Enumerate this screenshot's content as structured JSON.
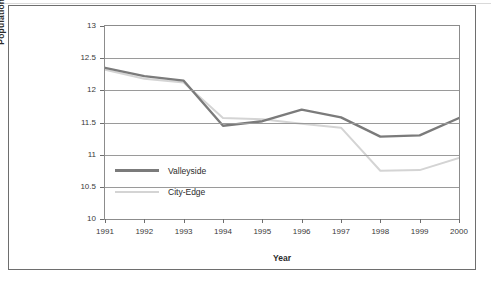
{
  "chart_data": {
    "type": "line",
    "title": "",
    "xlabel": "Year",
    "ylabel": "Population (thousands)",
    "categories": [
      "1991",
      "1992",
      "1993",
      "1994",
      "1995",
      "1996",
      "1997",
      "1998",
      "1999",
      "2000"
    ],
    "x": [
      1991,
      1992,
      1993,
      1994,
      1995,
      1996,
      1997,
      1998,
      1999,
      2000
    ],
    "xlim": [
      1991,
      2000
    ],
    "ylim": [
      10,
      13
    ],
    "yticks": [
      "10",
      "10.5",
      "11",
      "11.5",
      "12",
      "12.5",
      "13"
    ],
    "ytick_values": [
      10,
      10.5,
      11,
      11.5,
      12,
      12.5,
      13
    ],
    "grid": true,
    "legend_position": "inside-lower-left",
    "series": [
      {
        "name": "Valleyside",
        "color": "#7b7b7b",
        "line_width": 2.4,
        "values": [
          12.35,
          12.22,
          12.15,
          11.45,
          11.52,
          11.7,
          11.58,
          11.28,
          11.3,
          11.57
        ]
      },
      {
        "name": "City-Edge",
        "color": "#d4d4d4",
        "line_width": 2.0,
        "values": [
          12.32,
          12.18,
          12.12,
          11.57,
          11.55,
          11.48,
          11.42,
          10.75,
          10.76,
          10.95
        ]
      }
    ]
  },
  "axis": {
    "y_title": "Population (thousands)",
    "x_title": "Year"
  },
  "legend": {
    "items": [
      {
        "label": "Valleyside",
        "color": "#7b7b7b"
      },
      {
        "label": "City-Edge",
        "color": "#d4d4d4"
      }
    ]
  },
  "colors": {
    "valleyside": "#7b7b7b",
    "city_edge": "#d4d4d4",
    "grid": "#9a9a9a",
    "frame": "#6e6e6e",
    "text": "#2b2b2b",
    "background": "#ffffff"
  }
}
